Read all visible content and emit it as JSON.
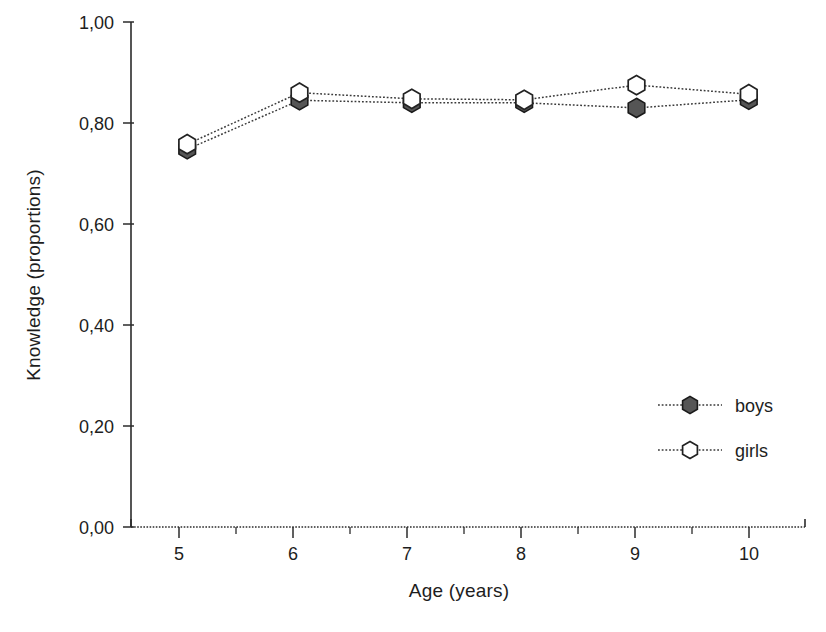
{
  "figure": {
    "background_color": "#ffffff",
    "ink_color": "#1d1d1d"
  },
  "chart_data": {
    "type": "line",
    "title": "",
    "subtitle": "",
    "xlabel": "Age (years)",
    "ylabel": "Knowledge (proportions)",
    "x": [
      5,
      6,
      7,
      8,
      9,
      10
    ],
    "xtick_labels": [
      "5",
      "6",
      "7",
      "8",
      "9",
      "10"
    ],
    "ytick_labels": [
      "0,00",
      "0,20",
      "0,40",
      "0,60",
      "0,80",
      "1,00"
    ],
    "ytick_values": [
      0.0,
      0.2,
      0.4,
      0.6,
      0.8,
      1.0
    ],
    "xlim": [
      4.5,
      10.5
    ],
    "ylim": [
      0.0,
      1.0
    ],
    "grid": false,
    "minor_xticks": true,
    "decimal_separator": ",",
    "legend_position": "lower right",
    "legend_frame": false,
    "series": [
      {
        "name": "boys",
        "marker": "filled-hexagon",
        "marker_fill": "#555555",
        "marker_edge": "#1a1a1a",
        "line_style": "dotted",
        "values": [
          0.748,
          0.845,
          0.84,
          0.84,
          0.83,
          0.846
        ]
      },
      {
        "name": "girls",
        "marker": "open-hexagon",
        "marker_fill": "#ffffff",
        "marker_edge": "#222222",
        "line_style": "dotted",
        "values": [
          0.758,
          0.86,
          0.848,
          0.846,
          0.875,
          0.857
        ]
      }
    ]
  },
  "legend": {
    "entries": [
      {
        "label": "boys"
      },
      {
        "label": "girls"
      }
    ]
  }
}
